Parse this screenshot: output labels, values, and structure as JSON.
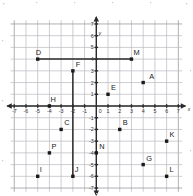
{
  "figure": {
    "kind": "coordinate-plane",
    "axis_labels": {
      "x": "x",
      "y": "y"
    },
    "origin_label": "0"
  },
  "chart_data": {
    "type": "scatter",
    "title": "",
    "xlabel": "x",
    "ylabel": "y",
    "xlim": [
      -7,
      7
    ],
    "ylim": [
      -7,
      7
    ],
    "grid": true,
    "legend": "none",
    "xticks": [
      -7,
      -6,
      -5,
      -4,
      -3,
      -2,
      -1,
      0,
      1,
      2,
      3,
      4,
      5,
      6,
      7
    ],
    "yticks": [
      -7,
      -6,
      -5,
      -4,
      -3,
      -2,
      -1,
      0,
      1,
      2,
      3,
      4,
      5,
      6,
      7
    ],
    "xtick_labels": [
      "-7",
      "-6",
      "-5",
      "-4",
      "-3",
      "-2",
      "-1",
      "0",
      "1",
      "2",
      "3",
      "4",
      "5",
      "6",
      "7"
    ],
    "ytick_labels": [
      "-7",
      "-6",
      "-5",
      "-4",
      "-3",
      "-2",
      "-1",
      "0",
      "1",
      "2",
      "3",
      "4",
      "5",
      "6",
      "7"
    ],
    "points": [
      {
        "label": "A",
        "x": 4,
        "y": 2,
        "lx": 6,
        "ly": -4
      },
      {
        "label": "B",
        "x": 2,
        "y": -2,
        "lx": 3,
        "ly": -4
      },
      {
        "label": "C",
        "x": -3,
        "y": -2,
        "lx": 3,
        "ly": -4
      },
      {
        "label": "D",
        "x": -5,
        "y": 4,
        "lx": -2,
        "ly": -4
      },
      {
        "label": "E",
        "x": 1,
        "y": 1,
        "lx": 3,
        "ly": -4
      },
      {
        "label": "F",
        "x": -2,
        "y": 3,
        "lx": 3,
        "ly": -4
      },
      {
        "label": "G",
        "x": 4,
        "y": -5,
        "lx": 3,
        "ly": -4
      },
      {
        "label": "H",
        "x": -4,
        "y": 0,
        "lx": 1,
        "ly": -4
      },
      {
        "label": "I",
        "x": -5,
        "y": -6,
        "lx": 2,
        "ly": -4
      },
      {
        "label": "J",
        "x": -2,
        "y": -6,
        "lx": 2,
        "ly": -4
      },
      {
        "label": "K",
        "x": 6,
        "y": -3,
        "lx": 3,
        "ly": -4
      },
      {
        "label": "L",
        "x": 6,
        "y": -6,
        "lx": 3,
        "ly": -4
      },
      {
        "label": "M",
        "x": 3,
        "y": 4,
        "lx": 2,
        "ly": -4
      },
      {
        "label": "N",
        "x": 0,
        "y": -4,
        "lx": 3,
        "ly": -4
      },
      {
        "label": "P",
        "x": -4,
        "y": -4,
        "lx": 2,
        "ly": -4
      }
    ],
    "segments": [
      {
        "name": "segment-DM",
        "from": "D",
        "x1": -5,
        "y1": 4,
        "x2": 3,
        "y2": 4
      },
      {
        "name": "segment-FJ",
        "from": "F",
        "x1": -2,
        "y1": 3,
        "x2": -2,
        "y2": -6
      }
    ]
  },
  "colors": {
    "grid": "#b9b9c0",
    "axis": "#2a2a2a",
    "point": "#1a1a1a",
    "background": "#ffffff"
  }
}
